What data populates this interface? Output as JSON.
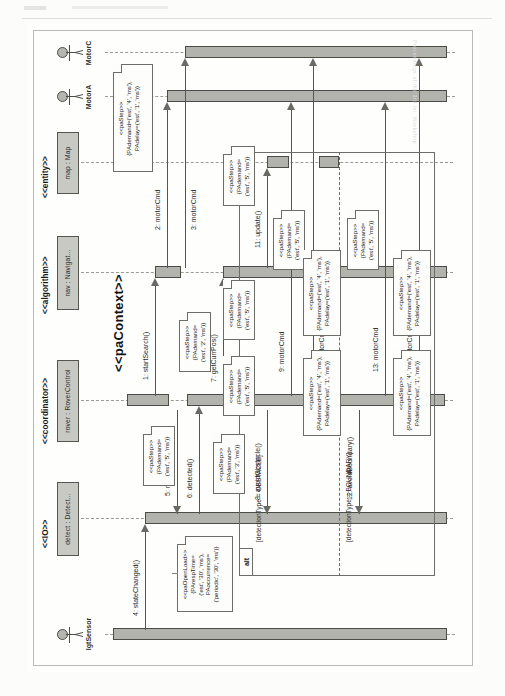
{
  "diagram": {
    "kind": "uml-sequence-diagram",
    "title": "paContext",
    "context_stereotype": "<<paContext>>",
    "page_watermark": "Proceedings of the 3rd Int. Workshop"
  },
  "actors": [
    {
      "name": "lgtSensor",
      "label": "lgtSensor"
    },
    {
      "name": "motor-a",
      "label": "MotorA"
    },
    {
      "name": "motor-c",
      "label": "MotorC"
    }
  ],
  "lifelines": [
    {
      "stereotype": "<<IO>>",
      "label": "detect : Detect..."
    },
    {
      "stereotype": "<<coordinator>>",
      "label": "rover : RoverControl"
    },
    {
      "stereotype": "<<algorithm>>",
      "label": "nav : Navigat..."
    },
    {
      "stereotype": "<<entity>>",
      "label": "map : Map"
    }
  ],
  "messages": [
    {
      "num": "1",
      "label": "1: startSearch()"
    },
    {
      "num": "2",
      "label": "2: motorCmd"
    },
    {
      "num": "3",
      "label": "3: motorCmd"
    },
    {
      "num": "4",
      "label": "4: stateChanged()"
    },
    {
      "num": "5",
      "label": "5: resolveSensor()"
    },
    {
      "num": "6",
      "label": "6: detected()"
    },
    {
      "num": "7",
      "label": "7: getCurrPos()"
    },
    {
      "num": "8",
      "label": "8: avoidObstacle()"
    },
    {
      "num": "9",
      "label": "9: motorCmd"
    },
    {
      "num": "10",
      "label": "10: motorCmd"
    },
    {
      "num": "11",
      "label": "11: update()"
    },
    {
      "num": "12",
      "label": "12: avoidBoundary()"
    },
    {
      "num": "13",
      "label": "13: motorCmd"
    },
    {
      "num": "14",
      "label": "14: motorCmd"
    }
  ],
  "fragment": {
    "operator": "alt",
    "guard_obstacle": "[detectionType = OBSTACLE]",
    "guard_boundary": "[detectionType = BOUNDARY]"
  },
  "notes": {
    "open_load": "<<paOpenLoad>>\n{PArespTime=\n('est', '30', 'ms'),\nPAoccurrence=\n('periodic', '30', 'ms')}",
    "step_2ms": "<<paStep>>\n{PAdemand=\n('est', '2', 'ms')}",
    "step_3ms": "<<paStep>>\n{PAdemand=\n('est', '3', 'ms')}",
    "step_5ms_a": "<<paStep>>\n{PAdemand=\n('est', '5', 'ms')}",
    "step_5ms_b": "<<paStep>>\n{PAdemand=\n('est', '5', 'ms')}",
    "step_5ms_c": "<<paStep>>\n{PAdemand=\n('est', '5', 'ms')}",
    "step_5ms_d": "<<paStep>>\n{PAdemand=\n('est', '5', 'ms')}",
    "step_5ms_e": "<<paStep>>\n{PAdemand=\n('est', '5', 'ms')}",
    "step_5ms_f": "<<paStep>>\n{PAdemand=\n('est', '5', 'ms')}",
    "step_4ms_a": "<<paStep>>\n{PAdemand=('est', '4', 'ms'),\nPAdelay=('est', '1', 'ms')}",
    "step_4ms_b": "<<paStep>>\n{PAdemand=('est', '4', 'ms'),\nPAdelay=('est', '1', 'ms')}",
    "step_4ms_c": "<<paStep>>\n{PAdemand=('est', '4', 'ms'),\nPAdelay=('est', '1', 'ms')}",
    "step_4ms_d": "<<paStep>>\n{PAdemand=('est', '4', 'ms'),\nPAdelay=('est', '1', 'ms')}",
    "step_4ms_e": "<<paStep>>\n{PAdemand=('est', '4', 'ms'),\nPAdelay=('est', '1', 'ms')}"
  }
}
